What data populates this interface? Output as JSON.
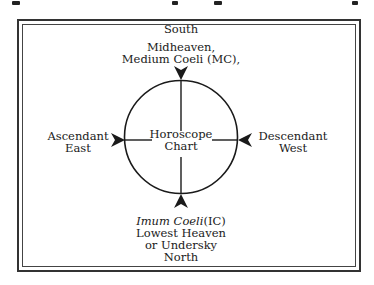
{
  "figure": {
    "caption_partial": "",
    "center_label": [
      "Horoscope",
      "Chart"
    ],
    "top": {
      "direction": "South",
      "lines": [
        "Midheaven,",
        "Medium Coeli (MC),"
      ]
    },
    "left": {
      "lines": [
        "Ascendant",
        "East"
      ]
    },
    "right": {
      "lines": [
        "Descendant",
        "West"
      ]
    },
    "bottom": {
      "italic": "Imum Coeli",
      "abbr": "(IC)",
      "lines": [
        "Lowest Heaven",
        "or Undersky",
        "North"
      ]
    }
  },
  "colors": {
    "ink": "#1a1a1a",
    "background": "#ffffff"
  }
}
